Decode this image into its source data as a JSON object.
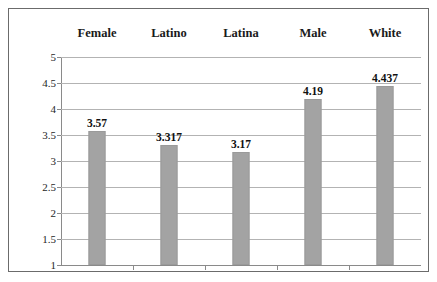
{
  "chart_data": {
    "type": "bar",
    "title": "",
    "subtitle": "",
    "xlabel": "",
    "ylabel": "",
    "categories": [
      "Female",
      "Latino",
      "Latina",
      "Male",
      "White"
    ],
    "values": [
      3.57,
      3.317,
      3.17,
      4.19,
      4.437
    ],
    "value_labels": [
      "3.57",
      "3.317",
      "3.17",
      "4.19",
      "4.437"
    ],
    "ylim": [
      1,
      5
    ],
    "ytick_step": 0.5,
    "ytick_labels": [
      "5",
      "4.5",
      "4",
      "3.5",
      "3",
      "2.5",
      "2",
      "1.5",
      "1"
    ],
    "ytick_values": [
      5,
      4.5,
      4,
      3.5,
      3,
      2.5,
      2,
      1.5,
      1
    ],
    "grid": true,
    "grid_axis": "y",
    "legend": false,
    "legend_position": "none",
    "series": [
      {
        "name": "",
        "values": [
          3.57,
          3.317,
          3.17,
          4.19,
          4.437
        ]
      }
    ],
    "colors": {
      "bar_fill": "#a3a3a3",
      "bar_border": "#9a9a9a",
      "gridline": "#b3b3b3",
      "axis": "#8a8a8a",
      "frame": "#6b6b6b",
      "text": "#1a1a1a",
      "background": "#ffffff"
    },
    "category_label_position": "top"
  }
}
